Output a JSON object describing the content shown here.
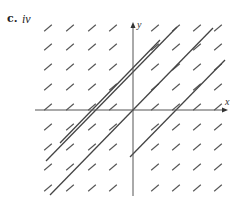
{
  "figure": {
    "part_label": "c.",
    "option_label": "iv",
    "x_axis_label": "x",
    "y_axis_label": "y",
    "colors": {
      "dash": "#555555",
      "line": "#444444",
      "axis": "#555555"
    }
  },
  "diagram": {
    "type": "slope-field",
    "origin_px": [
      133,
      110
    ],
    "x_axis": {
      "from": [
        35,
        110
      ],
      "to": [
        228,
        110
      ]
    },
    "y_axis": {
      "from": [
        133,
        196
      ],
      "to": [
        133,
        22
      ]
    },
    "grid_columns_px": [
      48,
      70,
      92,
      113,
      155,
      176,
      197,
      218
    ],
    "grid_rows_px": [
      28,
      47,
      67,
      87,
      107,
      127,
      147,
      167,
      188
    ],
    "dash_half_length": 5,
    "solution_lines": [
      {
        "from": [
          213,
          28
        ],
        "to": [
          50,
          195
        ]
      },
      {
        "from": [
          177,
          27
        ],
        "to": [
          46,
          161
        ]
      },
      {
        "from": [
          225,
          60
        ],
        "to": [
          130,
          157
        ]
      },
      {
        "from": [
          160,
          40
        ],
        "to": [
          60,
          143
        ]
      }
    ]
  }
}
